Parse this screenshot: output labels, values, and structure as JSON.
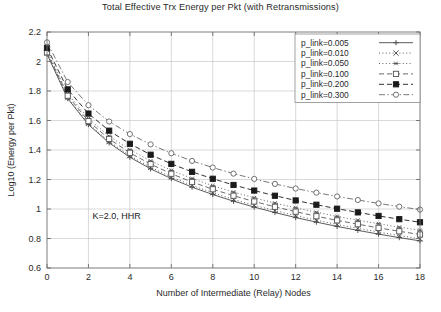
{
  "chart_data": {
    "type": "line",
    "title": "Total Effective Trx Energy per Pkt (with Retransmissions)",
    "xlabel": "Number of Intermediate (Relay) Nodes",
    "ylabel": "Log10 (Energy per Pkt)",
    "xlim": [
      0,
      18
    ],
    "ylim": [
      0.6,
      2.2
    ],
    "xticks": [
      0,
      2,
      4,
      6,
      8,
      10,
      12,
      14,
      16,
      18
    ],
    "xtick_labels": [
      "0",
      "2",
      "4",
      "6",
      "8",
      "10",
      "12",
      "14",
      "16",
      "18"
    ],
    "yticks": [
      0.6,
      0.8,
      1.0,
      1.2,
      1.4,
      1.6,
      1.8,
      2.0,
      2.2
    ],
    "ytick_labels": [
      "0.6",
      "0.8",
      "1",
      "1.2",
      "1.4",
      "1.6",
      "1.8",
      "2",
      "2.2"
    ],
    "grid": true,
    "legend_position": "top-right",
    "annotation": "K=2.0, HHR",
    "x": [
      0,
      1,
      2,
      3,
      4,
      5,
      6,
      7,
      8,
      9,
      10,
      11,
      12,
      13,
      14,
      15,
      16,
      17,
      18
    ],
    "series": [
      {
        "name": "p_link=0.005",
        "label": "p_link=0.005",
        "marker": "plus",
        "dash": "solid",
        "color": "#4a4a4a",
        "values": [
          2.05,
          1.748,
          1.572,
          1.448,
          1.351,
          1.272,
          1.206,
          1.148,
          1.098,
          1.053,
          1.013,
          0.976,
          0.942,
          0.911,
          0.882,
          0.855,
          0.83,
          0.806,
          0.784
        ]
      },
      {
        "name": "p_link=0.010",
        "label": "p_link=0.010",
        "marker": "cross",
        "dash": "dotted",
        "color": "#4a4a4a",
        "values": [
          2.055,
          1.755,
          1.58,
          1.457,
          1.361,
          1.283,
          1.217,
          1.16,
          1.11,
          1.065,
          1.025,
          0.989,
          0.955,
          0.924,
          0.895,
          0.869,
          0.844,
          0.82,
          0.798
        ]
      },
      {
        "name": "p_link=0.050",
        "label": "p_link=0.050",
        "marker": "asterisk",
        "dash": "dotted",
        "color": "#555555",
        "values": [
          2.072,
          1.782,
          1.613,
          1.494,
          1.402,
          1.326,
          1.262,
          1.207,
          1.158,
          1.115,
          1.076,
          1.04,
          1.008,
          0.978,
          0.95,
          0.924,
          0.9,
          0.877,
          0.856
        ]
      },
      {
        "name": "p_link=0.100",
        "label": "p_link=0.100",
        "marker": "open-square",
        "dash": "dashed",
        "color": "#5a5a5a",
        "values": [
          2.062,
          1.768,
          1.596,
          1.475,
          1.381,
          1.304,
          1.239,
          1.183,
          1.134,
          1.09,
          1.051,
          1.015,
          0.982,
          0.951,
          0.923,
          0.897,
          0.872,
          0.849,
          0.827
        ]
      },
      {
        "name": "p_link=0.200",
        "label": "p_link=0.200",
        "marker": "filled-square",
        "dash": "dashed",
        "color": "#1a1a1a",
        "values": [
          2.093,
          1.811,
          1.647,
          1.531,
          1.442,
          1.368,
          1.306,
          1.252,
          1.205,
          1.163,
          1.125,
          1.09,
          1.058,
          1.029,
          1.002,
          0.977,
          0.953,
          0.931,
          0.91
        ]
      },
      {
        "name": "p_link=0.300",
        "label": "p_link=0.300",
        "marker": "open-circle",
        "dash": "dashdot",
        "color": "#6a6a6a",
        "values": [
          2.13,
          1.861,
          1.704,
          1.593,
          1.508,
          1.438,
          1.378,
          1.326,
          1.281,
          1.24,
          1.204,
          1.17,
          1.139,
          1.111,
          1.085,
          1.061,
          1.038,
          1.016,
          0.996
        ]
      }
    ]
  }
}
